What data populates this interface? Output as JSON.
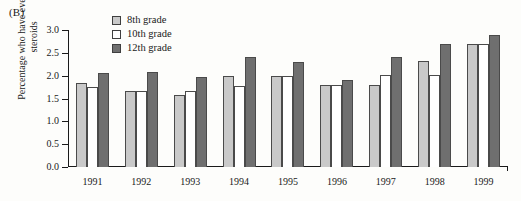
{
  "panel": {
    "label": "(B)"
  },
  "legend": {
    "items": [
      {
        "label": "8th grade",
        "key": "g8",
        "color": "#c9c9c9"
      },
      {
        "label": "10th grade",
        "key": "g10",
        "color": "#ffffff"
      },
      {
        "label": "12th grade",
        "key": "g12",
        "color": "#6f6f6f"
      }
    ]
  },
  "axis": {
    "yticks": [
      "3.0",
      "2.5",
      "2.0",
      "1.5",
      "1.0",
      "0.5",
      "0.0"
    ]
  },
  "chart_data": {
    "type": "bar",
    "title": "",
    "xlabel": "",
    "ylabel": "Percentage who have ever used steroids",
    "ylim": [
      0,
      3.0
    ],
    "ytick_values": [
      0.0,
      0.5,
      1.0,
      1.5,
      2.0,
      2.5,
      3.0
    ],
    "grid": false,
    "legend_position": "top-center",
    "categories": [
      "1991",
      "1992",
      "1993",
      "1994",
      "1995",
      "1996",
      "1997",
      "1998",
      "1999"
    ],
    "series": [
      {
        "name": "8th grade",
        "color": "#c9c9c9",
        "values": [
          1.85,
          1.67,
          1.57,
          2.0,
          2.0,
          1.8,
          1.8,
          2.33,
          2.7
        ]
      },
      {
        "name": "10th grade",
        "color": "#ffffff",
        "values": [
          1.75,
          1.67,
          1.67,
          1.77,
          2.0,
          1.8,
          2.01,
          2.02,
          2.7
        ]
      },
      {
        "name": "12th grade",
        "color": "#6f6f6f",
        "values": [
          2.05,
          2.07,
          1.98,
          2.4,
          2.3,
          1.9,
          2.4,
          2.7,
          2.9
        ]
      }
    ]
  }
}
